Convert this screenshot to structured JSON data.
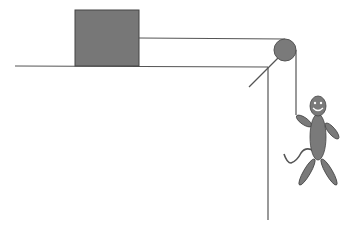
{
  "diagram": {
    "colors": {
      "line": "#555555",
      "fill": "#7a7a7a",
      "block_fill": "#777777",
      "face": "#ffffff"
    },
    "elements": [
      "block",
      "table",
      "string",
      "pulley",
      "pulley-bracket",
      "wall",
      "hanging-figure"
    ]
  }
}
